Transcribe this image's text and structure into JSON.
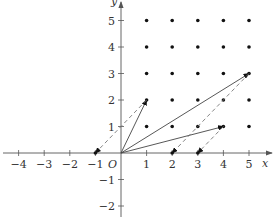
{
  "diagram": {
    "type": "coordinate-plane-lattice",
    "axes": {
      "x_label": "x",
      "y_label": "y",
      "origin_label": "O",
      "x_ticks": [
        -4,
        -3,
        -2,
        -1,
        1,
        2,
        3,
        4,
        5
      ],
      "y_ticks": [
        -2,
        -1,
        1,
        2,
        3,
        4,
        5
      ],
      "x_range": [
        -4.8,
        5.9
      ],
      "y_range": [
        -2.5,
        5.8
      ]
    },
    "lattice_points": {
      "x_values": [
        1,
        2,
        3,
        4,
        5
      ],
      "y_values": [
        1,
        2,
        3,
        4,
        5
      ]
    },
    "solid_vectors": [
      {
        "from": [
          0,
          0
        ],
        "to": [
          1,
          2
        ]
      },
      {
        "from": [
          0,
          0
        ],
        "to": [
          5,
          3
        ]
      },
      {
        "from": [
          0,
          0
        ],
        "to": [
          4,
          1
        ]
      }
    ],
    "dashed_vectors": [
      {
        "from": [
          1,
          2
        ],
        "to": [
          -1,
          0
        ]
      },
      {
        "from": [
          5,
          3
        ],
        "to": [
          2,
          0
        ]
      },
      {
        "from": [
          4,
          1
        ],
        "to": [
          3,
          0
        ]
      }
    ],
    "colors": {
      "axis": "#555555",
      "point": "#111111",
      "line": "#444444",
      "dashed": "#777777"
    }
  }
}
